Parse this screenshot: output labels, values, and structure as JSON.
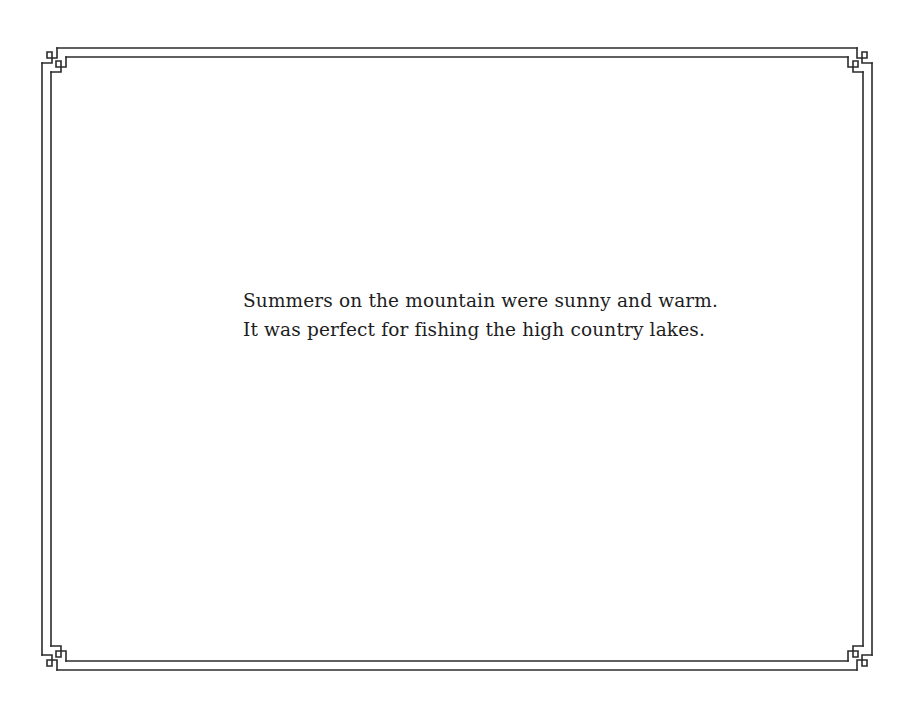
{
  "page": {
    "background_color": "#ffffff",
    "border_color": "#2b2b2b",
    "text_color": "#1e1e1e",
    "decoration": "double-line-border-with-square-key-corners"
  },
  "story": {
    "lines": [
      "Summers on the mountain were sunny and warm.",
      "It was perfect for fishing the high country lakes."
    ]
  }
}
